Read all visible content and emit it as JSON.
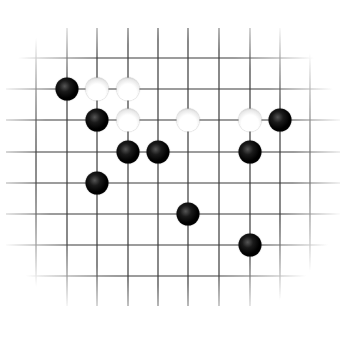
{
  "board": {
    "description": "Go board diagram (partial view, fading edges)",
    "grid": {
      "x_lines": [
        36,
        67,
        97,
        128,
        158,
        188,
        219,
        250,
        280,
        310
      ],
      "y_lines": [
        58,
        89,
        120,
        152,
        183,
        214,
        245,
        276
      ],
      "line_color": "#3a3a3a"
    },
    "stones": [
      {
        "color": "black",
        "col": 1,
        "row": 1
      },
      {
        "color": "white",
        "col": 2,
        "row": 1
      },
      {
        "color": "white",
        "col": 3,
        "row": 1
      },
      {
        "color": "black",
        "col": 2,
        "row": 2
      },
      {
        "color": "white",
        "col": 3,
        "row": 2
      },
      {
        "color": "white",
        "col": 5,
        "row": 2
      },
      {
        "color": "white",
        "col": 7,
        "row": 2
      },
      {
        "color": "black",
        "col": 8,
        "row": 2
      },
      {
        "color": "black",
        "col": 3,
        "row": 3
      },
      {
        "color": "black",
        "col": 4,
        "row": 3
      },
      {
        "color": "black",
        "col": 7,
        "row": 3
      },
      {
        "color": "black",
        "col": 2,
        "row": 4
      },
      {
        "color": "black",
        "col": 5,
        "row": 5
      },
      {
        "color": "black",
        "col": 7,
        "row": 6
      }
    ],
    "stone_counts": {
      "black": 10,
      "white": 4
    }
  }
}
